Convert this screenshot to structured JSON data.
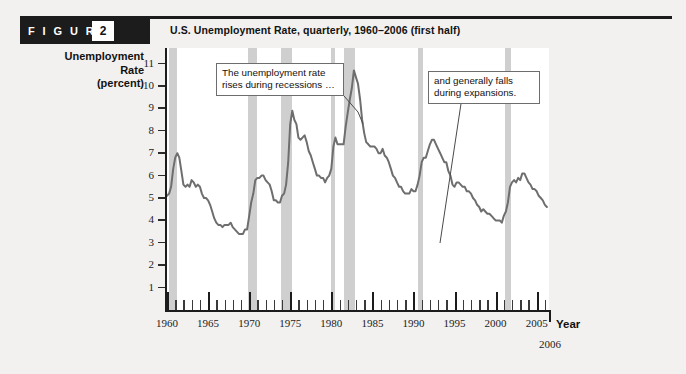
{
  "header": {
    "figure_word": "F I G U R E",
    "figure_number": "2",
    "title": "U.S. Unemployment Rate, quarterly, 1960–2006 (first half)"
  },
  "axes": {
    "y_label_line1": "Unemployment",
    "y_label_line2": "Rate",
    "y_label_line3": "(percent)",
    "y_ticks": [
      "11",
      "10",
      "9",
      "8",
      "7",
      "6",
      "5",
      "4",
      "3",
      "2",
      "1"
    ],
    "x_title": "Year",
    "x_ticks": [
      "1960",
      "1965",
      "1970",
      "1975",
      "1980",
      "1985",
      "1990",
      "1995",
      "2000",
      "2005"
    ],
    "x_end_label": "2006"
  },
  "annotations": {
    "left": "The unemployment rate rises during recessions …",
    "right": "and generally falls during expansions."
  },
  "colors": {
    "line": "#6e6e6e",
    "recession_band": "#cfcfcf",
    "header_bar": "#1c1c1c",
    "page_background": "#f2f1ef",
    "plot_background": "#ffffff",
    "axis": "#1c1c1c"
  },
  "chart_data": {
    "type": "line",
    "title": "U.S. Unemployment Rate, quarterly, 1960–2006 (first half)",
    "xlabel": "Year",
    "ylabel": "Unemployment Rate (percent)",
    "xlim": [
      1960,
      2006.5
    ],
    "ylim": [
      0,
      11.7
    ],
    "grid": false,
    "legend": "none",
    "series": [
      {
        "name": "U.S. unemployment rate (quarterly, percent)",
        "x": [
          1960.0,
          1960.25,
          1960.5,
          1960.75,
          1961.0,
          1961.25,
          1961.5,
          1961.75,
          1962.0,
          1962.25,
          1962.5,
          1962.75,
          1963.0,
          1963.25,
          1963.5,
          1963.75,
          1964.0,
          1964.25,
          1964.5,
          1964.75,
          1965.0,
          1965.25,
          1965.5,
          1965.75,
          1966.0,
          1966.25,
          1966.5,
          1966.75,
          1967.0,
          1967.25,
          1967.5,
          1967.75,
          1968.0,
          1968.25,
          1968.5,
          1968.75,
          1969.0,
          1969.25,
          1969.5,
          1969.75,
          1970.0,
          1970.25,
          1970.5,
          1970.75,
          1971.0,
          1971.25,
          1971.5,
          1971.75,
          1972.0,
          1972.25,
          1972.5,
          1972.75,
          1973.0,
          1973.25,
          1973.5,
          1973.75,
          1974.0,
          1974.25,
          1974.5,
          1974.75,
          1975.0,
          1975.25,
          1975.5,
          1975.75,
          1976.0,
          1976.25,
          1976.5,
          1976.75,
          1977.0,
          1977.25,
          1977.5,
          1977.75,
          1978.0,
          1978.25,
          1978.5,
          1978.75,
          1979.0,
          1979.25,
          1979.5,
          1979.75,
          1980.0,
          1980.25,
          1980.5,
          1980.75,
          1981.0,
          1981.25,
          1981.5,
          1981.75,
          1982.0,
          1982.25,
          1982.5,
          1982.75,
          1983.0,
          1983.25,
          1983.5,
          1983.75,
          1984.0,
          1984.25,
          1984.5,
          1984.75,
          1985.0,
          1985.25,
          1985.5,
          1985.75,
          1986.0,
          1986.25,
          1986.5,
          1986.75,
          1987.0,
          1987.25,
          1987.5,
          1987.75,
          1988.0,
          1988.25,
          1988.5,
          1988.75,
          1989.0,
          1989.25,
          1989.5,
          1989.75,
          1990.0,
          1990.25,
          1990.5,
          1990.75,
          1991.0,
          1991.25,
          1991.5,
          1991.75,
          1992.0,
          1992.25,
          1992.5,
          1992.75,
          1993.0,
          1993.25,
          1993.5,
          1993.75,
          1994.0,
          1994.25,
          1994.5,
          1994.75,
          1995.0,
          1995.25,
          1995.5,
          1995.75,
          1996.0,
          1996.25,
          1996.5,
          1996.75,
          1997.0,
          1997.25,
          1997.5,
          1997.75,
          1998.0,
          1998.25,
          1998.5,
          1998.75,
          1999.0,
          1999.25,
          1999.5,
          1999.75,
          2000.0,
          2000.25,
          2000.5,
          2000.75,
          2001.0,
          2001.25,
          2001.5,
          2001.75,
          2002.0,
          2002.25,
          2002.5,
          2002.75,
          2003.0,
          2003.25,
          2003.5,
          2003.75,
          2004.0,
          2004.25,
          2004.5,
          2004.75,
          2005.0,
          2005.25,
          2005.5,
          2005.75,
          2006.0,
          2006.25
        ],
        "y": [
          5.1,
          5.2,
          5.5,
          6.3,
          6.8,
          7.0,
          6.8,
          6.2,
          5.6,
          5.5,
          5.6,
          5.5,
          5.8,
          5.7,
          5.5,
          5.6,
          5.5,
          5.2,
          5.0,
          5.0,
          4.9,
          4.7,
          4.4,
          4.1,
          3.9,
          3.8,
          3.8,
          3.7,
          3.8,
          3.8,
          3.8,
          3.9,
          3.7,
          3.6,
          3.5,
          3.4,
          3.4,
          3.4,
          3.6,
          3.6,
          4.2,
          4.8,
          5.2,
          5.8,
          5.9,
          5.9,
          6.0,
          6.0,
          5.8,
          5.7,
          5.6,
          5.3,
          4.9,
          4.9,
          4.8,
          4.8,
          5.1,
          5.2,
          5.6,
          6.6,
          8.3,
          8.9,
          8.5,
          8.3,
          7.7,
          7.6,
          7.7,
          7.8,
          7.5,
          7.1,
          6.9,
          6.6,
          6.3,
          6.0,
          6.0,
          5.9,
          5.9,
          5.7,
          5.9,
          6.0,
          6.3,
          7.3,
          7.7,
          7.4,
          7.4,
          7.4,
          7.4,
          8.2,
          8.8,
          9.4,
          9.9,
          10.7,
          10.4,
          10.1,
          9.4,
          8.5,
          7.9,
          7.5,
          7.4,
          7.3,
          7.3,
          7.3,
          7.2,
          7.0,
          7.0,
          7.2,
          6.9,
          6.8,
          6.6,
          6.3,
          6.0,
          5.9,
          5.7,
          5.5,
          5.5,
          5.3,
          5.2,
          5.2,
          5.2,
          5.4,
          5.3,
          5.3,
          5.6,
          6.0,
          6.6,
          6.8,
          6.8,
          7.1,
          7.4,
          7.6,
          7.6,
          7.4,
          7.2,
          7.0,
          6.8,
          6.6,
          6.6,
          6.2,
          6.0,
          5.6,
          5.5,
          5.7,
          5.7,
          5.6,
          5.5,
          5.5,
          5.3,
          5.3,
          5.2,
          5.0,
          4.9,
          4.7,
          4.6,
          4.4,
          4.5,
          4.4,
          4.3,
          4.3,
          4.2,
          4.1,
          4.0,
          4.0,
          4.0,
          3.9,
          4.2,
          4.4,
          4.8,
          5.5,
          5.7,
          5.8,
          5.7,
          5.9,
          5.8,
          6.1,
          6.1,
          5.9,
          5.7,
          5.6,
          5.4,
          5.4,
          5.3,
          5.1,
          5.0,
          4.9,
          4.7,
          4.6
        ],
        "line_color": "#6e6e6e",
        "line_width": 2.0
      }
    ],
    "shaded_regions": {
      "label": "U.S. recessions (NBER)",
      "color": "#cfcfcf",
      "bands": [
        {
          "start": 1960.3,
          "end": 1961.2
        },
        {
          "start": 1969.9,
          "end": 1970.9
        },
        {
          "start": 1973.9,
          "end": 1975.2
        },
        {
          "start": 1980.0,
          "end": 1980.5
        },
        {
          "start": 1981.5,
          "end": 1982.9
        },
        {
          "start": 1990.5,
          "end": 1991.2
        },
        {
          "start": 2001.2,
          "end": 2001.9
        }
      ]
    },
    "annotations": [
      {
        "text": "The unemployment rate rises during recessions …",
        "points_to_x": 1982.3,
        "points_to_y": 10.4
      },
      {
        "text": "and generally falls during expansions.",
        "points_to_x": 2000.0,
        "points_to_y": 4.0
      }
    ]
  }
}
